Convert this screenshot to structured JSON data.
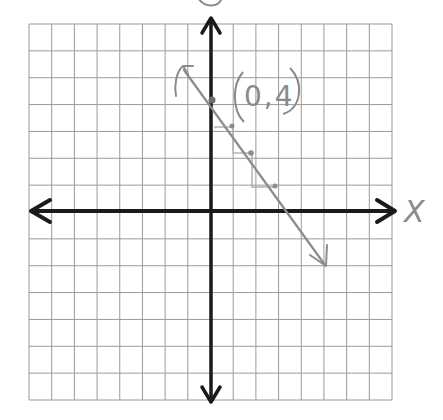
{
  "chart_data": {
    "type": "line",
    "title": "",
    "xlabel": "X",
    "ylabel": "y",
    "grid": true,
    "xlim": [
      -8,
      8
    ],
    "ylim": [
      -7,
      7
    ],
    "series": [
      {
        "name": "hand-drawn line",
        "equation": "y = -x + 4",
        "slope": -1,
        "y_intercept": 4,
        "points": [
          [
            0,
            4
          ],
          [
            1,
            3
          ],
          [
            2,
            2
          ],
          [
            3,
            1
          ]
        ],
        "line_extent": [
          [
            -1.25,
            5.3
          ],
          [
            5.1,
            -2.0
          ]
        ],
        "color": "#8c8c8c"
      }
    ],
    "annotations": [
      {
        "text": "(0,4)",
        "x": 0,
        "y": 4
      }
    ]
  },
  "labels": {
    "x_axis": "X",
    "y_axis": "y",
    "point_label": "(0,4)"
  },
  "colors": {
    "grid": "#9a9a9a",
    "axis": "#1a1a1a",
    "pencil": "#8c8c8c",
    "background": "#ffffff"
  }
}
